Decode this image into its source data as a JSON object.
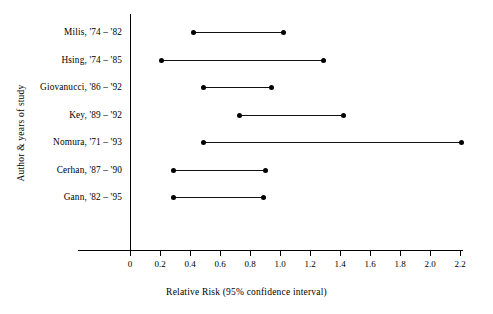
{
  "chart_data": {
    "type": "scatter",
    "subtype": "forest-plot",
    "title": "",
    "xlabel": "Relative Risk (95% confidence interval)",
    "ylabel": "Author & years of study",
    "xlim": [
      0,
      2.2
    ],
    "xticks": [
      0,
      0.2,
      0.4,
      0.6,
      0.8,
      1.0,
      1.2,
      1.4,
      1.6,
      1.8,
      2.0,
      2.2
    ],
    "xtick_labels": [
      "0",
      "0.2",
      "0.4",
      "0.6",
      "0.8",
      "1.0",
      "1.2",
      "1.4",
      "1.6",
      "1.8",
      "2.0",
      "2.2"
    ],
    "grid": false,
    "legend": false,
    "marker_color": "#000000",
    "line_color": "#111111",
    "categories": [
      "Milis, '74 – '82",
      "Hsing, '74 – '85",
      "Giovanucci, '86 – '92",
      "Key, '89 – '92",
      "Nomura, '71 – '93",
      "Cerhan, '87 – '90",
      "Gann, '82 – '95"
    ],
    "intervals": [
      {
        "label": "Milis, '74 – '82",
        "low": 0.42,
        "high": 1.02
      },
      {
        "label": "Hsing, '74 – '85",
        "low": 0.21,
        "high": 1.29
      },
      {
        "label": "Giovanucci, '86 – '92",
        "low": 0.49,
        "high": 0.94
      },
      {
        "label": "Key, '89 – '92",
        "low": 0.73,
        "high": 1.42
      },
      {
        "label": "Nomura, '71 – '93",
        "low": 0.49,
        "high": 2.21
      },
      {
        "label": "Cerhan, '87 – '90",
        "low": 0.29,
        "high": 0.9
      },
      {
        "label": "Gann, '82 – '95",
        "low": 0.29,
        "high": 0.89
      }
    ]
  }
}
